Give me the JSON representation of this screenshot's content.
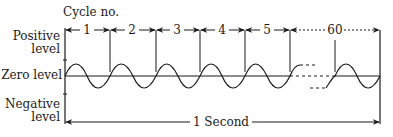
{
  "diagram": {
    "title": "Cycle no.",
    "labels": {
      "positive": [
        "Positive",
        "level"
      ],
      "zero": "Zero level",
      "negative": [
        "Negative",
        "level"
      ],
      "duration": "1 Second"
    },
    "cycles": [
      "1",
      "2",
      "3",
      "4",
      "5",
      "60"
    ],
    "colors": {
      "line": "#1a1a1a",
      "background": "#ffffff"
    }
  }
}
